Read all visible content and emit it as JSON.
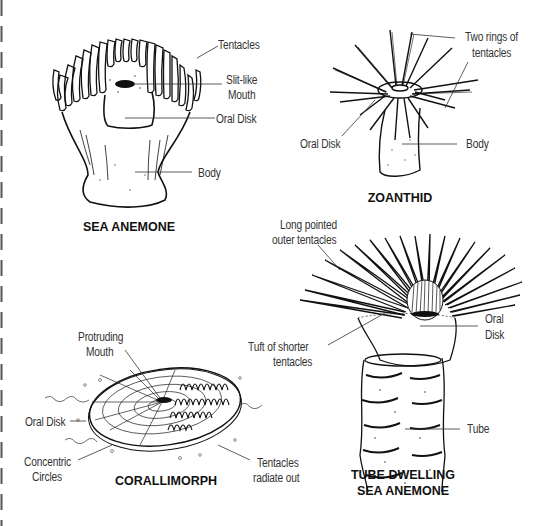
{
  "diagram": {
    "panels": [
      {
        "id": "sea-anemone",
        "title": "SEA ANEMONE",
        "labels": [
          "Tentacles",
          "Slit-like",
          "Mouth",
          "Oral Disk",
          "Body"
        ]
      },
      {
        "id": "zoanthid",
        "title": "ZOANTHID",
        "labels": [
          "Two rings of",
          "tentacles",
          "Oral Disk",
          "Body"
        ]
      },
      {
        "id": "corallimorph",
        "title": "CORALLIMORPH",
        "labels": [
          "Protruding",
          "Mouth",
          "Oral Disk",
          "Concentric",
          "Circles",
          "Tentacles",
          "radiate out"
        ]
      },
      {
        "id": "tube-dwelling-sea-anemone",
        "title_line1": "TUBE DWELLING",
        "title_line2": "SEA ANEMONE",
        "labels": [
          "Long pointed",
          "outer tentacles",
          "Tuft of shorter",
          "tentacles",
          "Oral",
          "Disk",
          "Tube"
        ]
      }
    ],
    "colors": {
      "ink": "#111111",
      "background": "#ffffff",
      "label": "#333333"
    }
  }
}
